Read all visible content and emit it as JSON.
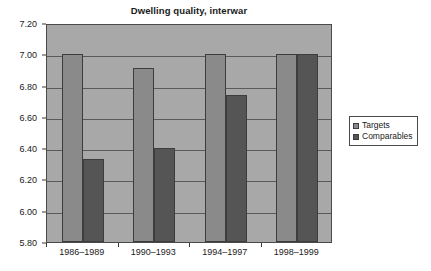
{
  "chart_data": {
    "type": "bar",
    "title": "Dwelling quality, interwar",
    "xlabel": "",
    "ylabel": "",
    "categories": [
      "1986–1989",
      "1990–1993",
      "1994–1997",
      "1998–1999"
    ],
    "series": [
      {
        "name": "Targets",
        "values": [
          7.0,
          6.91,
          7.0,
          7.0
        ],
        "color": "#8a8a8a"
      },
      {
        "name": "Comparables",
        "values": [
          6.33,
          6.4,
          6.74,
          7.0
        ],
        "color": "#555555"
      }
    ],
    "ylim": [
      5.8,
      7.2
    ],
    "ytick_step": 0.2,
    "ytick_labels": [
      "7.20",
      "7.00",
      "6.80",
      "6.60",
      "6.40",
      "6.20",
      "6.00",
      "5.80"
    ],
    "ytick_values": [
      7.2,
      7.0,
      6.8,
      6.6,
      6.4,
      6.2,
      6.0,
      5.8
    ],
    "grid": true,
    "legend_position": "right",
    "plot_background": "#a8a8a8",
    "axis_color": "#4a4a4a",
    "gridline_color": "#5a5a5a"
  },
  "legend": {
    "entries": [
      {
        "label": "Targets"
      },
      {
        "label": "Comparables"
      }
    ]
  }
}
